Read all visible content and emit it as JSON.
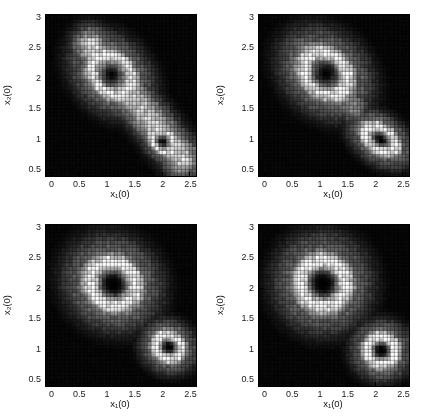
{
  "figure": {
    "background": "#ffffff",
    "colormap": "gray",
    "panel_count": 4
  },
  "axes": {
    "xlabel": "x₁(0)",
    "xlabel_base": "x",
    "xlabel_sub": "1",
    "xlabel_tail": "(0)",
    "ylabel_base": "x",
    "ylabel_sub": "2",
    "ylabel_tail": "(0)",
    "xticks": [
      "0",
      "0.5",
      "1",
      "1.5",
      "2",
      "2.5"
    ],
    "xtick_values": [
      0,
      0.5,
      1,
      1.5,
      2,
      2.5
    ],
    "yticks": [
      "0.5",
      "1",
      "1.5",
      "2",
      "2.5",
      "3"
    ],
    "ytick_values": [
      0.5,
      1,
      1.5,
      2,
      2.5,
      3
    ],
    "xlim": [
      -0.1,
      2.6
    ],
    "ylim": [
      0.4,
      3.05
    ],
    "grid": false,
    "box": true
  },
  "chart_data": [
    {
      "id": "panel-top-left",
      "type": "heatmap",
      "title": "",
      "xlabel": "x₁(0)",
      "ylabel": "x₂(0)",
      "xlim": [
        -0.1,
        2.6
      ],
      "ylim": [
        0.4,
        3.05
      ],
      "nx": 40,
      "ny": 43,
      "cmap": "gray",
      "vmin": 0,
      "vmax": 1,
      "description": "Elongated diagonal ridge linking two dark minima; bright band runs from upper-left to lower-right",
      "features": [
        {
          "kind": "dark-core",
          "cx": 1.08,
          "cy": 2.08,
          "rx": 0.26,
          "ry": 0.22,
          "angle_deg": -38
        },
        {
          "kind": "bright-ring",
          "cx": 1.08,
          "cy": 2.08,
          "rx": 0.52,
          "ry": 0.38,
          "angle_deg": -38,
          "intensity": 1.0
        },
        {
          "kind": "dark-core",
          "cx": 2.0,
          "cy": 0.98,
          "rx": 0.14,
          "ry": 0.11,
          "angle_deg": -38
        },
        {
          "kind": "bright-ring",
          "cx": 2.0,
          "cy": 0.98,
          "rx": 0.3,
          "ry": 0.2,
          "angle_deg": -38,
          "intensity": 0.95
        },
        {
          "kind": "bright-ridge",
          "x0": 0.7,
          "y0": 2.55,
          "x1": 2.35,
          "y1": 0.7,
          "width": 0.3,
          "intensity": 0.85
        }
      ]
    },
    {
      "id": "panel-top-right",
      "type": "heatmap",
      "title": "",
      "xlabel": "x₁(0)",
      "ylabel": "x₂(0)",
      "xlim": [
        -0.1,
        2.6
      ],
      "ylim": [
        0.4,
        3.05
      ],
      "nx": 40,
      "ny": 43,
      "cmap": "gray",
      "vmin": 0,
      "vmax": 1,
      "description": "Upper ring about (1.1,2.1) with dark core; lower-right elongated bright blob about (2.1,1.0) with faint core",
      "features": [
        {
          "kind": "dark-core",
          "cx": 1.1,
          "cy": 2.1,
          "rx": 0.26,
          "ry": 0.23,
          "angle_deg": -32
        },
        {
          "kind": "bright-ring",
          "cx": 1.1,
          "cy": 2.1,
          "rx": 0.55,
          "ry": 0.42,
          "angle_deg": -32,
          "intensity": 1.0
        },
        {
          "kind": "dark-core",
          "cx": 2.1,
          "cy": 1.0,
          "rx": 0.09,
          "ry": 0.07,
          "angle_deg": -32
        },
        {
          "kind": "bright-ring",
          "cx": 2.08,
          "cy": 1.02,
          "rx": 0.4,
          "ry": 0.25,
          "angle_deg": -32,
          "intensity": 1.0
        },
        {
          "kind": "bright-ridge",
          "x0": 0.72,
          "y0": 2.5,
          "x1": 1.6,
          "y1": 1.55,
          "width": 0.26,
          "intensity": 0.55
        }
      ]
    },
    {
      "id": "panel-bottom-left",
      "type": "heatmap",
      "title": "",
      "xlabel": "x₁(0)",
      "ylabel": "x₂(0)",
      "xlim": [
        -0.1,
        2.6
      ],
      "ylim": [
        0.4,
        3.05
      ],
      "nx": 40,
      "ny": 43,
      "cmap": "gray",
      "vmin": 0,
      "vmax": 1,
      "description": "Two well-separated bright rings with dark cores at (1.1,2.1) and (2.1,1.05)",
      "features": [
        {
          "kind": "dark-core",
          "cx": 1.12,
          "cy": 2.08,
          "rx": 0.25,
          "ry": 0.23,
          "angle_deg": -20
        },
        {
          "kind": "bright-ring",
          "cx": 1.1,
          "cy": 2.1,
          "rx": 0.55,
          "ry": 0.47,
          "angle_deg": -20,
          "intensity": 1.0
        },
        {
          "kind": "dark-core",
          "cx": 2.12,
          "cy": 1.05,
          "rx": 0.1,
          "ry": 0.09,
          "angle_deg": -20
        },
        {
          "kind": "bright-ring",
          "cx": 2.1,
          "cy": 1.06,
          "rx": 0.32,
          "ry": 0.27,
          "angle_deg": -20,
          "intensity": 1.0
        }
      ]
    },
    {
      "id": "panel-bottom-right",
      "type": "heatmap",
      "title": "",
      "xlabel": "x₁(0)",
      "ylabel": "x₂(0)",
      "xlim": [
        -0.1,
        2.6
      ],
      "ylim": [
        0.4,
        3.05
      ],
      "nx": 40,
      "ny": 43,
      "cmap": "gray",
      "vmin": 0,
      "vmax": 1,
      "description": "Two circular bright rings with dark cores at (1.05,2.1) and (2.1,1.0); tighter than bottom-left",
      "features": [
        {
          "kind": "dark-core",
          "cx": 1.05,
          "cy": 2.1,
          "rx": 0.26,
          "ry": 0.25,
          "angle_deg": -10
        },
        {
          "kind": "bright-ring",
          "cx": 1.05,
          "cy": 2.1,
          "rx": 0.54,
          "ry": 0.5,
          "angle_deg": -10,
          "intensity": 1.0
        },
        {
          "kind": "dark-core",
          "cx": 2.1,
          "cy": 1.0,
          "rx": 0.13,
          "ry": 0.12,
          "angle_deg": -10
        },
        {
          "kind": "bright-ring",
          "cx": 2.1,
          "cy": 1.0,
          "rx": 0.34,
          "ry": 0.31,
          "angle_deg": -10,
          "intensity": 1.0
        }
      ]
    }
  ]
}
